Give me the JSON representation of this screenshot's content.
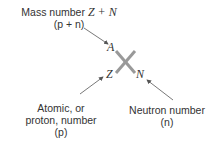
{
  "diagram": {
    "mass_label": {
      "line1_text": "Mass number ",
      "line1_formula": "Z + N",
      "line2": "(p + n)"
    },
    "atomic_label": {
      "line1": "Atomic, or",
      "line2": "proton, number",
      "line3": "(p)"
    },
    "neutron_label": {
      "line1": "Neutron number",
      "line2": "(n)"
    },
    "symbols": {
      "A": "A",
      "Z": "Z",
      "N": "N"
    },
    "colors": {
      "cross": "#999999",
      "arrow": "#555555",
      "text": "#333333"
    }
  }
}
